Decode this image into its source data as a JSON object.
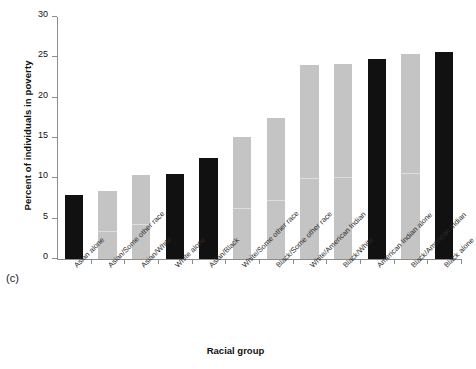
{
  "panel": {
    "label": "(c)"
  },
  "chart_data": {
    "type": "bar",
    "title": "",
    "subtitle": "",
    "xlabel": "Racial group",
    "ylabel": "Percent of individuals in poverty",
    "ylim": [
      0,
      30
    ],
    "yticks": [
      0,
      5,
      10,
      15,
      20,
      25,
      30
    ],
    "grid": false,
    "legend": "none",
    "categories": [
      "Asian alone",
      "Asian/Some other race",
      "Asian/White",
      "White alone",
      "Asian/Black",
      "White/Some other race",
      "Black/Some other race",
      "White/American Indian",
      "Black/White",
      "American Indian alone",
      "Black/American Indian",
      "Black alone"
    ],
    "values": [
      7.9,
      8.4,
      10.4,
      10.5,
      12.5,
      15.1,
      17.5,
      24.0,
      24.2,
      24.8,
      25.4,
      25.7
    ],
    "bar_colors": [
      "#111111",
      "#c4c4c4",
      "#c4c4c4",
      "#111111",
      "#111111",
      "#c4c4c4",
      "#c4c4c4",
      "#c4c4c4",
      "#c4c4c4",
      "#111111",
      "#c4c4c4",
      "#111111"
    ],
    "colors": {
      "single_race": "#111111",
      "multi_race": "#c4c4c4",
      "axis": "#8d8d8d",
      "text": "#111111",
      "background": "#ffffff"
    }
  }
}
